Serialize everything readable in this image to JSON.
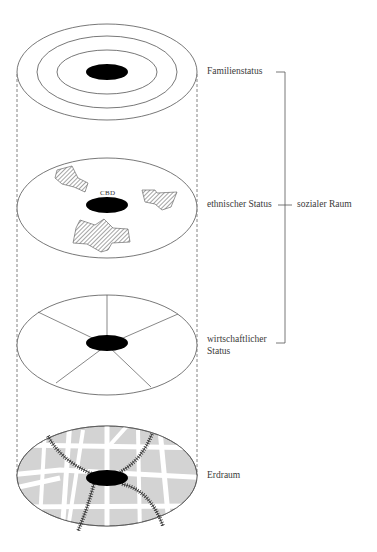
{
  "diagram": {
    "type": "layered-city-model",
    "layers": [
      {
        "id": "familienstatus",
        "label": "Familienstatus",
        "pattern": "concentric-rings"
      },
      {
        "id": "ethnischer-status",
        "label": "ethnischer Status",
        "pattern": "clusters",
        "center_label": "CBD"
      },
      {
        "id": "wirtschaftlicher-status",
        "label_line1": "wirtschaftlicher",
        "label_line2": "Status",
        "pattern": "sectors"
      },
      {
        "id": "erdraum",
        "label": "Erdraum",
        "pattern": "street-map"
      }
    ],
    "bracket": {
      "label": "sozialer Raum",
      "spans": [
        "Familienstatus",
        "ethnischer Status",
        "wirtschaftlicher Status"
      ]
    },
    "colors": {
      "line": "#555555",
      "core": "#000000",
      "hatch": "#666666",
      "map_fill": "#d3d3d3",
      "street": "#ffffff",
      "rail": "#333333"
    }
  }
}
